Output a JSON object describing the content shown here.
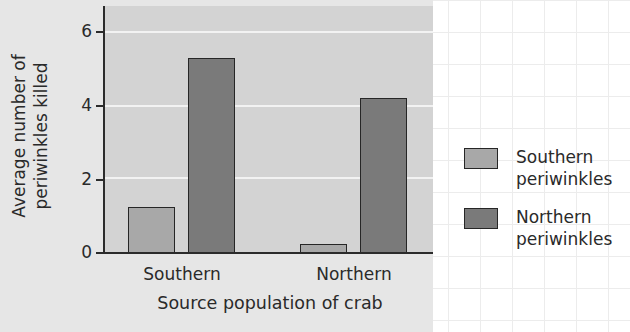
{
  "chart_data": {
    "type": "bar",
    "title": "",
    "xlabel": "Source population of crab",
    "ylabel": "Average number of periwinkles killed",
    "ylabel_lines": [
      "Average number of",
      "periwinkles killed"
    ],
    "categories": [
      "Southern",
      "Northern"
    ],
    "series": [
      {
        "name": "Southern periwinkles",
        "values": [
          1.25,
          0.25
        ],
        "color": "#a8a8a8"
      },
      {
        "name": "Northern periwinkles",
        "values": [
          5.3,
          4.2
        ],
        "color": "#7a7a7a"
      }
    ],
    "yticks": [
      0,
      2,
      4,
      6
    ],
    "ylim": [
      0,
      6.7
    ],
    "grid": true,
    "legend_position": "right",
    "legend": [
      {
        "line1": "Southern",
        "line2": "periwinkles"
      },
      {
        "line1": "Northern",
        "line2": "periwinkles"
      }
    ]
  },
  "colors": {
    "plot_bg": "#d3d3d3",
    "panel_bg": "#e6e6e6",
    "southern_bar": "#a8a8a8",
    "northern_bar": "#7a7a7a",
    "axis": "#2b2b2b"
  }
}
